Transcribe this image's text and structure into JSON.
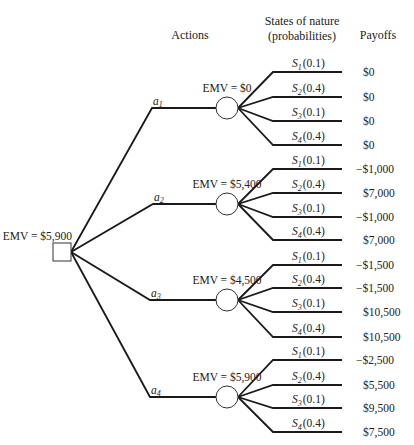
{
  "headers": {
    "actions": "Actions",
    "states_line1": "States of nature",
    "states_line2": "(probabilities)",
    "payoffs": "Payoffs"
  },
  "root": {
    "label": "EMV = $5,900",
    "x": 53,
    "y": 243,
    "size": 18
  },
  "actions": [
    {
      "name": "a",
      "sub": "1",
      "emv": "EMV = $0",
      "elbow": [
        152,
        108
      ],
      "cy": 108,
      "branches": [
        {
          "s": "S",
          "sub": "1",
          "p": "(0.1)",
          "y": 72,
          "payoff": "$0"
        },
        {
          "s": "S",
          "sub": "2",
          "p": "(0.4)",
          "y": 97,
          "payoff": "$0"
        },
        {
          "s": "S",
          "sub": "3",
          "p": "(0.1)",
          "y": 121,
          "payoff": "$0"
        },
        {
          "s": "S",
          "sub": "4",
          "p": "(0.4)",
          "y": 145,
          "payoff": "$0"
        }
      ]
    },
    {
      "name": "a",
      "sub": "2",
      "emv": "EMV = $5,400",
      "elbow": [
        153,
        204
      ],
      "cy": 204,
      "branches": [
        {
          "s": "S",
          "sub": "1",
          "p": "(0.1)",
          "y": 169,
          "payoff": "−$1,000"
        },
        {
          "s": "S",
          "sub": "2",
          "p": "(0.4)",
          "y": 193,
          "payoff": "$7,000"
        },
        {
          "s": "S",
          "sub": "3",
          "p": "(0.1)",
          "y": 217,
          "payoff": "−$1,000"
        },
        {
          "s": "S",
          "sub": "4",
          "p": "(0.4)",
          "y": 240,
          "payoff": "$7,000"
        }
      ]
    },
    {
      "name": "a",
      "sub": "3",
      "emv": "EMV = $4,500",
      "elbow": [
        150,
        300
      ],
      "cy": 300,
      "branches": [
        {
          "s": "S",
          "sub": "1",
          "p": "(0.1)",
          "y": 265,
          "payoff": "−$1,500"
        },
        {
          "s": "S",
          "sub": "2",
          "p": "(0.4)",
          "y": 288,
          "payoff": "−$1,500"
        },
        {
          "s": "S",
          "sub": "3",
          "p": "(0.1)",
          "y": 312,
          "payoff": "$10,500"
        },
        {
          "s": "S",
          "sub": "4",
          "p": "(0.4)",
          "y": 337,
          "payoff": "$10,500"
        }
      ]
    },
    {
      "name": "a",
      "sub": "4",
      "emv": "EMV = $5,900",
      "elbow": [
        150,
        397
      ],
      "cy": 397,
      "branches": [
        {
          "s": "S",
          "sub": "1",
          "p": "(0.1)",
          "y": 360,
          "payoff": "−$2,500"
        },
        {
          "s": "S",
          "sub": "2",
          "p": "(0.4)",
          "y": 385,
          "payoff": "$5,500"
        },
        {
          "s": "S",
          "sub": "3",
          "p": "(0.1)",
          "y": 408,
          "payoff": "$9,500"
        },
        {
          "s": "S",
          "sub": "4",
          "p": "(0.4)",
          "y": 432,
          "payoff": "$7,500"
        }
      ]
    }
  ],
  "geometry": {
    "chance_cx": 227,
    "chance_r": 11,
    "branch_elbow_x": 273,
    "branch_end_x": 342,
    "payoff_x": 363
  }
}
